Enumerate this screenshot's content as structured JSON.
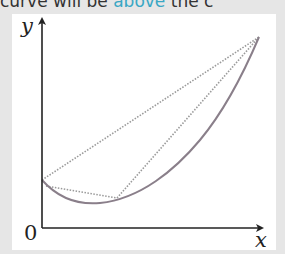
{
  "banner": {
    "before": "curve will be ",
    "highlight": "above",
    "after": " the c",
    "highlight_color": "#3aa7c4"
  },
  "figure": {
    "axis_labels": {
      "x": "x",
      "y": "y",
      "origin": "0"
    },
    "curve": {
      "description": "convex curve dipping to a minimum then rising steeply",
      "color": "#8a7f8a",
      "points_px": [
        [
          42,
          180
        ],
        [
          60,
          194
        ],
        [
          90,
          203
        ],
        [
          117,
          198
        ],
        [
          150,
          182
        ],
        [
          190,
          150
        ],
        [
          230,
          95
        ],
        [
          259,
          37
        ]
      ]
    },
    "chords": [
      {
        "name": "long-chord",
        "from": [
          42,
          180
        ],
        "to": [
          259,
          37
        ],
        "style": "dotted"
      },
      {
        "name": "lower-chord",
        "from": [
          46,
          186
        ],
        "to": [
          117,
          198
        ],
        "style": "dotted"
      },
      {
        "name": "right-chord",
        "from": [
          117,
          198
        ],
        "to": [
          259,
          37
        ],
        "style": "dotted"
      }
    ],
    "colors": {
      "axis": "#222222",
      "chord": "#999999",
      "panel": "#ffffff",
      "background": "#e6e6e6"
    }
  }
}
